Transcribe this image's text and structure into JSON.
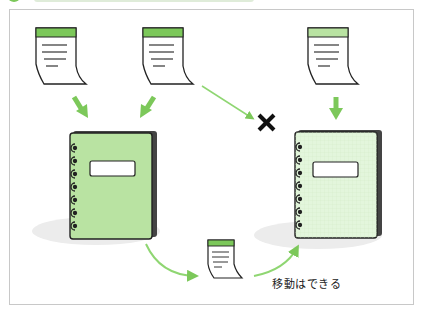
{
  "diagram": {
    "title": "",
    "accent_color": "#7cc85a",
    "notebook_a_color": "#b9e3a2",
    "notebook_b_color": "#e3f6dc",
    "documents": [
      {
        "id": "doc-1",
        "target": "notebook-a",
        "relation": "add"
      },
      {
        "id": "doc-2",
        "target": "notebook-a",
        "relation": "add"
      },
      {
        "id": "doc-2",
        "target": "notebook-b",
        "relation": "not-allowed"
      },
      {
        "id": "doc-3",
        "target": "notebook-b",
        "relation": "add"
      },
      {
        "id": "doc-moved",
        "from": "notebook-a",
        "to": "notebook-b",
        "relation": "move"
      }
    ],
    "blocked_mark": "✕",
    "caption": "移動はできる"
  }
}
